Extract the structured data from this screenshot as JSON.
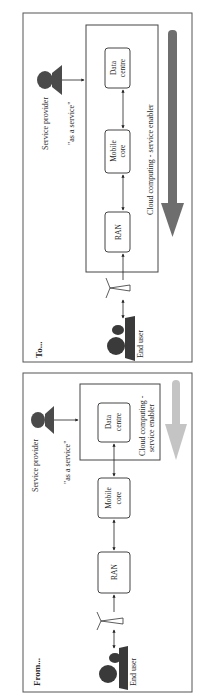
{
  "orientation": "rotated-90-ccw",
  "panels": [
    {
      "id": "to",
      "title": "To...",
      "service_provider_label": "Service provider",
      "as_a_service_label": "\"as a service\"",
      "end_user_label": "End user",
      "cloud_label": "Cloud computing - service enabler",
      "boxes": [
        {
          "label_line1": "RAN",
          "label_line2": ""
        },
        {
          "label_line1": "Mobile",
          "label_line2": "core"
        },
        {
          "label_line1": "Data",
          "label_line2": "centre"
        }
      ],
      "arrow_color": "#6e6e6e"
    },
    {
      "id": "from",
      "title": "From...",
      "service_provider_label": "Service provider",
      "as_a_service_label": "\"as a service\"",
      "end_user_label": "End user",
      "cloud_label_line1": "Cloud computing -",
      "cloud_label_line2": "service enabler",
      "boxes": [
        {
          "label_line1": "RAN",
          "label_line2": ""
        },
        {
          "label_line1": "Mobile",
          "label_line2": "core"
        },
        {
          "label_line1": "Data",
          "label_line2": "centre"
        }
      ],
      "arrow_color": "#c4c4c4"
    }
  ]
}
